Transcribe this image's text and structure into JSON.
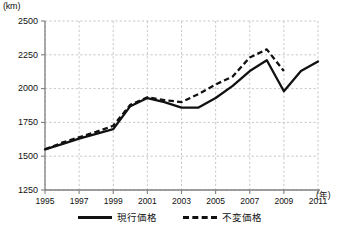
{
  "chart_data": {
    "type": "line",
    "title": "",
    "xlabel": "年",
    "ylabel": "km",
    "y_unit_label": "(km)",
    "x_unit_label": "(年)",
    "x": [
      1995,
      1996,
      1997,
      1998,
      1999,
      2000,
      2001,
      2002,
      2003,
      2004,
      2005,
      2006,
      2007,
      2008,
      2009,
      2010,
      2011
    ],
    "xlim": [
      1995,
      2011
    ],
    "ylim": [
      1250,
      2500
    ],
    "yticks": [
      1250,
      1500,
      1750,
      2000,
      2250,
      2500
    ],
    "ytick_labels": [
      "1250",
      "1500",
      "1750",
      "2000",
      "2250",
      "2500"
    ],
    "xticks": [
      1995,
      1997,
      1999,
      2001,
      2003,
      2005,
      2007,
      2009,
      2011
    ],
    "xtick_labels": [
      "1995",
      "1997",
      "1999",
      "2001",
      "2003",
      "2005",
      "2007",
      "2009",
      "2011"
    ],
    "grid": true,
    "legend_position": "bottom",
    "series": [
      {
        "name": "現行価格",
        "style": "solid",
        "color": "#111111",
        "x": [
          1995,
          1996,
          1997,
          1998,
          1999,
          2000,
          2001,
          2002,
          2003,
          2004,
          2005,
          2006,
          2007,
          2008,
          2009,
          2010,
          2011
        ],
        "values": [
          1550,
          1590,
          1630,
          1665,
          1700,
          1870,
          1930,
          1900,
          1860,
          1860,
          1930,
          2020,
          2130,
          2210,
          1980,
          2130,
          2200
        ]
      },
      {
        "name": "不変価格",
        "style": "dashed",
        "color": "#111111",
        "x": [
          1995,
          1996,
          1997,
          1998,
          1999,
          2000,
          2001,
          2002,
          2003,
          2004,
          2005,
          2006,
          2007,
          2008,
          2009
        ],
        "values": [
          1550,
          1600,
          1640,
          1680,
          1725,
          1880,
          1935,
          1915,
          1900,
          1960,
          2030,
          2090,
          2230,
          2290,
          2130
        ]
      }
    ]
  },
  "legend": {
    "items": [
      {
        "label": "現行価格",
        "style": "solid"
      },
      {
        "label": "不変価格",
        "style": "dashed"
      }
    ]
  }
}
